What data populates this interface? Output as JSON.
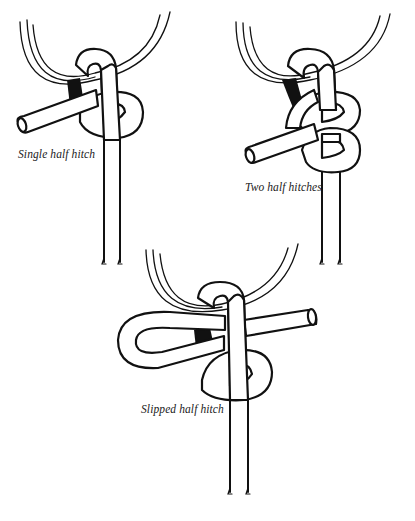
{
  "figure": {
    "panels": [
      {
        "id": "single-half-hitch",
        "caption": "Single half hitch"
      },
      {
        "id": "two-half-hitches",
        "caption": "Two half hitches"
      },
      {
        "id": "slipped-half-hitch",
        "caption": "Slipped half hitch"
      }
    ],
    "colors": {
      "ink": "#111111",
      "paper": "#ffffff"
    }
  }
}
